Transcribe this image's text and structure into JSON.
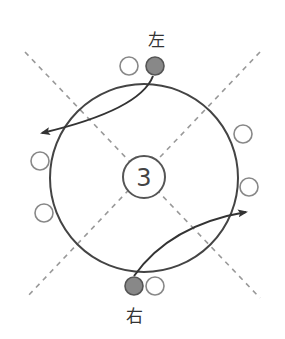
{
  "diagram": {
    "title": "",
    "labels": {
      "top": "左",
      "bottom": "右",
      "center": "3"
    },
    "colors": {
      "stroke": "#444444",
      "dash": "#999999",
      "filled_marker": "#888888",
      "open_marker_stroke": "#888888",
      "background": "#ffffff"
    },
    "elements": {
      "main_circle": {
        "cx": 144,
        "cy": 178,
        "r": 94
      },
      "center_circle": {
        "cx": 144,
        "cy": 177,
        "r": 21
      },
      "dashed_diagonals": [
        {
          "from": [
            25,
            52
          ],
          "to": [
            260,
            298
          ]
        },
        {
          "from": [
            260,
            52
          ],
          "to": [
            26,
            298
          ]
        }
      ],
      "filled_markers": [
        {
          "name": "left-player",
          "cx": 155,
          "cy": 66,
          "r": 9
        },
        {
          "name": "right-player",
          "cx": 134,
          "cy": 286,
          "r": 9
        }
      ],
      "open_markers": [
        {
          "cx": 129,
          "cy": 66,
          "r": 9
        },
        {
          "cx": 40,
          "cy": 161,
          "r": 9
        },
        {
          "cx": 44,
          "cy": 213,
          "r": 9
        },
        {
          "cx": 243,
          "cy": 134,
          "r": 9
        },
        {
          "cx": 249,
          "cy": 187,
          "r": 9
        },
        {
          "cx": 155,
          "cy": 286,
          "r": 9
        }
      ],
      "arrows": [
        {
          "name": "arrow-from-left",
          "path": "M 153 76 Q 140 110 42 133"
        },
        {
          "name": "arrow-from-right",
          "path": "M 134 276 Q 170 225 246 212"
        }
      ]
    }
  }
}
